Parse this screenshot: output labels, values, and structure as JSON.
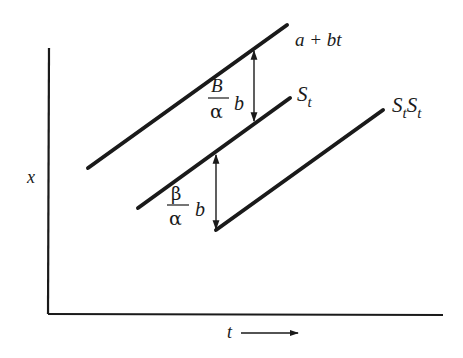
{
  "figure": {
    "type": "schematic line diagram",
    "background": "#ffffff",
    "stroke_color": "#1a1a1a"
  },
  "axes": {
    "y_label": "x",
    "x_label": "t",
    "x_label_arrow": "→"
  },
  "lines": [
    {
      "id": "trend",
      "label": "a + bt",
      "from": [
        88,
        168
      ],
      "to": [
        287,
        25
      ]
    },
    {
      "id": "s-t",
      "label_base": "S",
      "label_sub": "t",
      "from": [
        138,
        208
      ],
      "to": [
        290,
        98
      ]
    },
    {
      "id": "s-t-s-t",
      "label_base1": "S",
      "label_sub1": "t",
      "label_base2": "S",
      "label_sub2": "t",
      "from": [
        216,
        230
      ],
      "to": [
        383,
        110
      ]
    }
  ],
  "gaps": [
    {
      "id": "upper-gap",
      "numerator": "B",
      "denominator": "α",
      "factor": "b",
      "arrow": "double-headed",
      "x": 254,
      "y_top": 52,
      "y_bottom": 120
    },
    {
      "id": "lower-gap",
      "numerator": "β",
      "denominator": "α",
      "factor": "b",
      "arrow": "double-headed",
      "x": 216,
      "y_top": 155,
      "y_bottom": 229
    }
  ]
}
